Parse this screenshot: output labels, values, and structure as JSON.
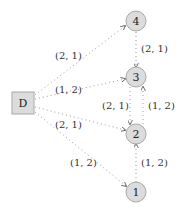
{
  "diagram": {
    "source": {
      "id": "D",
      "label": "D"
    },
    "nodes": [
      {
        "id": "4",
        "label": "4"
      },
      {
        "id": "3",
        "label": "3"
      },
      {
        "id": "2",
        "label": "2"
      },
      {
        "id": "1",
        "label": "1"
      }
    ],
    "edges": [
      {
        "from": "D",
        "to": "4",
        "label": "(2, 1)"
      },
      {
        "from": "D",
        "to": "3",
        "label": "(1, 2)"
      },
      {
        "from": "D",
        "to": "2",
        "label": "(2, 1)"
      },
      {
        "from": "D",
        "to": "1",
        "label": "(1, 2)"
      },
      {
        "from": "4",
        "to": "3",
        "label": "(2, 1)"
      },
      {
        "from": "3",
        "to": "2",
        "label": "(2, 1)"
      },
      {
        "from": "2",
        "to": "3",
        "label": "(1, 2)"
      },
      {
        "from": "1",
        "to": "2",
        "label": "(1, 2)"
      }
    ]
  }
}
